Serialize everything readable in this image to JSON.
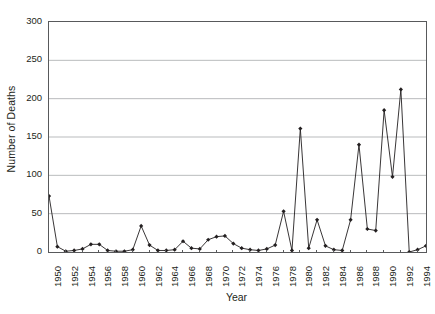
{
  "chart_data": {
    "type": "line",
    "title": "",
    "xlabel": "Year",
    "ylabel": "Number of Deaths",
    "xlim": [
      1950,
      1995
    ],
    "ylim": [
      0,
      300
    ],
    "ytick_step": 50,
    "xtick_step": 2,
    "grid": "horizontal",
    "legend": "none",
    "marker": "filled-diamond",
    "line_color": "#231f20",
    "marker_color": "#231f20",
    "grid_color": "#a7a9ac",
    "axis_color": "#58595b",
    "y_ticks": [
      0,
      50,
      100,
      150,
      200,
      250,
      300
    ],
    "y_tick_labels": [
      "0",
      "50",
      "100",
      "150",
      "200",
      "250",
      "300"
    ],
    "x_tick_labels": [
      "1950",
      "1952",
      "1954",
      "1956",
      "1958",
      "1960",
      "1962",
      "1964",
      "1966",
      "1968",
      "1970",
      "1972",
      "1974",
      "1976",
      "1978",
      "1980",
      "1982",
      "1984",
      "1986",
      "1988",
      "1990",
      "1992",
      "1994"
    ],
    "x": [
      1950,
      1951,
      1952,
      1953,
      1954,
      1955,
      1956,
      1957,
      1958,
      1959,
      1960,
      1961,
      1962,
      1963,
      1964,
      1965,
      1966,
      1967,
      1968,
      1969,
      1970,
      1971,
      1972,
      1973,
      1974,
      1975,
      1976,
      1977,
      1978,
      1979,
      1980,
      1981,
      1982,
      1983,
      1984,
      1985,
      1986,
      1987,
      1988,
      1989,
      1990,
      1991,
      1992,
      1993,
      1994,
      1995
    ],
    "values": [
      73,
      7,
      1,
      2,
      4,
      10,
      10,
      2,
      1,
      1,
      3,
      34,
      9,
      2,
      2,
      3,
      14,
      5,
      4,
      16,
      20,
      21,
      11,
      5,
      3,
      2,
      4,
      9,
      53,
      2,
      161,
      5,
      42,
      8,
      3,
      2,
      42,
      140,
      30,
      28,
      185,
      98,
      212,
      0,
      3,
      8
    ],
    "series": [
      {
        "name": "Number of Deaths",
        "values": [
          73,
          7,
          1,
          2,
          4,
          10,
          10,
          2,
          1,
          1,
          3,
          34,
          9,
          2,
          2,
          3,
          14,
          5,
          4,
          16,
          20,
          21,
          11,
          5,
          3,
          2,
          4,
          9,
          53,
          2,
          161,
          5,
          42,
          8,
          3,
          2,
          42,
          140,
          30,
          28,
          185,
          98,
          212,
          0,
          3,
          8
        ]
      }
    ]
  }
}
